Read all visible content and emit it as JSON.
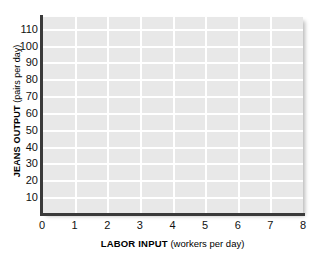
{
  "chart_data": {
    "type": "line",
    "title": "",
    "subtitle": "",
    "xlabel_bold": "LABOR INPUT",
    "xlabel_paren": "(workers per day)",
    "ylabel_bold": "JEANS OUTPUT",
    "ylabel_paren": "(pairs per day)",
    "xlabel": "LABOR INPUT (workers per day)",
    "ylabel": "JEANS OUTPUT (pairs per day)",
    "x_ticks": [
      0,
      1,
      2,
      3,
      4,
      5,
      6,
      7,
      8
    ],
    "y_ticks": [
      10,
      20,
      30,
      40,
      50,
      60,
      70,
      80,
      90,
      100,
      110
    ],
    "xlim": [
      0,
      8
    ],
    "ylim": [
      0,
      117
    ],
    "grid": true,
    "legend": "none",
    "series": [],
    "values": [],
    "categories": [],
    "annotations": [],
    "plot_background_color": "#e8e8e8",
    "gridline_color": "#ffffff",
    "axis_color": "#3a3a3a",
    "canvas_background_color": "#ffffff"
  }
}
